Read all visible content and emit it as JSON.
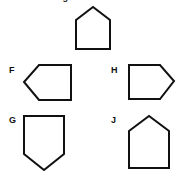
{
  "page": {
    "background_color": "#ffffff",
    "stroke_color": "#111111",
    "fill_color": "#ffffff",
    "text_color": "#111111"
  },
  "header": {
    "clipped_prompt": "ased on the figure",
    "note": "top line of text is cut off by the top edge of the image"
  },
  "prompt_figure": {
    "name": "reference-shape",
    "shape_kind": "pentagon-house-up",
    "label": "",
    "box": {
      "x": 75,
      "y": 6,
      "width": 36,
      "height": 44
    },
    "points": "1,14 18,1 35,14 35,43 1,43"
  },
  "choices": [
    {
      "id": "F",
      "label": "F",
      "shape_kind": "pentagon-point-left",
      "label_pos": {
        "x": 9,
        "y": 66
      },
      "box": {
        "x": 23,
        "y": 64,
        "width": 49,
        "height": 37
      },
      "points": "16,1 48,1 48,36 16,36 1,18"
    },
    {
      "id": "H",
      "label": "H",
      "shape_kind": "pentagon-point-right",
      "label_pos": {
        "x": 111,
        "y": 66
      },
      "box": {
        "x": 128,
        "y": 64,
        "width": 47,
        "height": 36
      },
      "points": "1,1 32,1 46,17 32,35 1,35"
    },
    {
      "id": "G",
      "label": "G",
      "shape_kind": "pentagon-point-down",
      "label_pos": {
        "x": 9,
        "y": 116
      },
      "box": {
        "x": 23,
        "y": 115,
        "width": 43,
        "height": 56
      },
      "points": "1,1 41,1 41,39 21,55 1,39"
    },
    {
      "id": "J",
      "label": "J",
      "shape_kind": "pentagon-house-up",
      "label_pos": {
        "x": 111,
        "y": 116
      },
      "box": {
        "x": 128,
        "y": 115,
        "width": 43,
        "height": 54
      },
      "points": "1,16 21,1 41,16 41,53 1,53"
    }
  ]
}
